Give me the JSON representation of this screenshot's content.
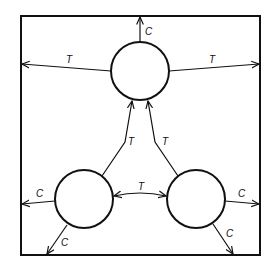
{
  "diagram": {
    "type": "flow-network",
    "boundary": "square enclosure",
    "nodes": [
      {
        "id": "top",
        "label": ""
      },
      {
        "id": "bottom-left",
        "label": ""
      },
      {
        "id": "bottom-right",
        "label": ""
      }
    ],
    "edges": [
      {
        "from": "top",
        "to": "boundary-top",
        "label": "C"
      },
      {
        "from": "top",
        "to": "boundary-left",
        "label": "T"
      },
      {
        "from": "top",
        "to": "boundary-right",
        "label": "T"
      },
      {
        "from": "bottom-left",
        "to": "top",
        "label": "T"
      },
      {
        "from": "bottom-right",
        "to": "top",
        "label": "T"
      },
      {
        "from": "bottom-left",
        "to": "bottom-right",
        "label": "T",
        "bidirectional": true
      },
      {
        "from": "bottom-left",
        "to": "boundary-left",
        "label": "C"
      },
      {
        "from": "bottom-left",
        "to": "boundary-bottom",
        "label": "C"
      },
      {
        "from": "bottom-right",
        "to": "boundary-right",
        "label": "C"
      },
      {
        "from": "bottom-right",
        "to": "boundary-bottom",
        "label": "C"
      }
    ]
  },
  "labels": {
    "top_up": "C",
    "top_left": "T",
    "top_right": "T",
    "bl_to_top": "T",
    "br_to_top": "T",
    "bl_br": "T",
    "bl_left": "C",
    "bl_down": "C",
    "br_right": "C",
    "br_down": "C"
  }
}
